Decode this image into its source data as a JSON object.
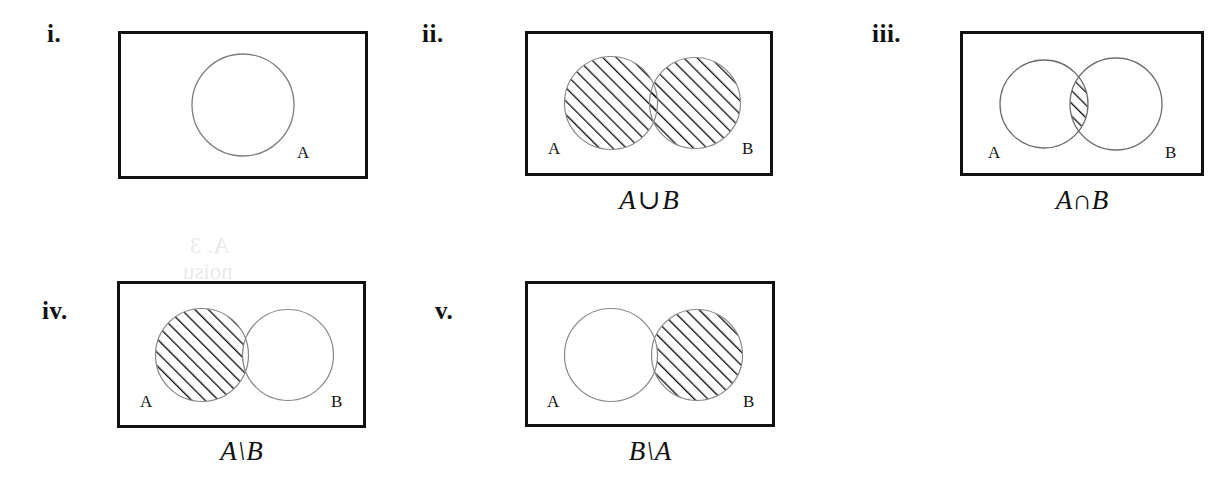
{
  "figure": {
    "background_color": "#ffffff",
    "rect_stroke_color": "#111111",
    "circle_stroke_color": "#7d7d7d",
    "hatch_color": "#111111"
  },
  "panels": [
    {
      "id": "i",
      "numeral": "i.",
      "caption_parts": null,
      "caption_text": "",
      "sets": [
        {
          "label": "A"
        }
      ],
      "shaded_region": "none",
      "description": "Single circle A inside the universe rectangle, unshaded"
    },
    {
      "id": "ii",
      "numeral": "ii.",
      "caption_text": "A ∪ B",
      "caption_parts": {
        "left": "A",
        "operator": "∪",
        "right": "B"
      },
      "sets": [
        {
          "label": "A"
        },
        {
          "label": "B"
        }
      ],
      "shaded_region": "union",
      "description": "Two overlapping circles, entire union hatched"
    },
    {
      "id": "iii",
      "numeral": "iii.",
      "caption_text": "A ∩ B",
      "caption_parts": {
        "left": "A",
        "operator": "∩",
        "right": "B"
      },
      "sets": [
        {
          "label": "A"
        },
        {
          "label": "B"
        }
      ],
      "shaded_region": "intersection",
      "description": "Two overlapping circles, only the lens intersection hatched"
    },
    {
      "id": "iv",
      "numeral": "iv.",
      "caption_text": "A \\ B",
      "caption_parts": {
        "left": "A",
        "operator": "\\",
        "right": "B"
      },
      "sets": [
        {
          "label": "A"
        },
        {
          "label": "B"
        }
      ],
      "shaded_region": "a-minus-b",
      "description": "Two overlapping circles, circle A minus the overlap hatched"
    },
    {
      "id": "v",
      "numeral": "v.",
      "caption_text": "B \\ A",
      "caption_parts": {
        "left": "B",
        "operator": "\\",
        "right": "A"
      },
      "sets": [
        {
          "label": "A"
        },
        {
          "label": "B"
        }
      ],
      "shaded_region": "b-minus-a",
      "description": "Two overlapping circles, circle B minus the overlap hatched"
    }
  ],
  "ghost_text": {
    "line1": "A. 3",
    "line2": "noisu"
  }
}
